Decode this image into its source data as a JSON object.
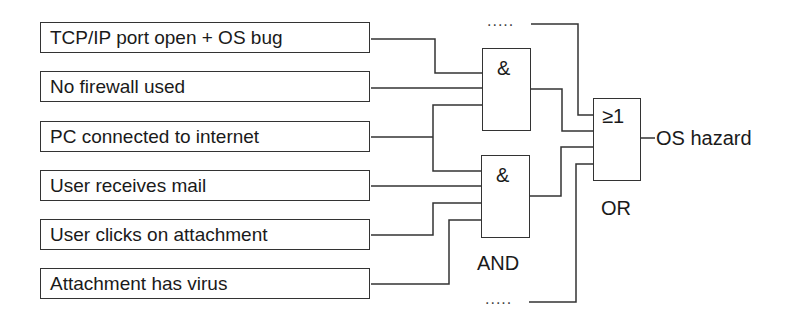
{
  "diagram": {
    "type": "fault-tree",
    "inputs": [
      {
        "label": "TCP/IP port open + OS bug"
      },
      {
        "label": "No firewall used"
      },
      {
        "label": "PC connected to internet"
      },
      {
        "label": "User receives mail"
      },
      {
        "label": "User clicks on attachment"
      },
      {
        "label": "Attachment has virus"
      }
    ],
    "gates": {
      "and_upper": {
        "symbol": "&"
      },
      "and_lower": {
        "symbol": "&",
        "caption": "AND"
      },
      "or": {
        "symbol": "≥1",
        "caption": "OR"
      }
    },
    "output": {
      "label": "OS hazard"
    },
    "ellipsis": {
      "top": ".....",
      "bottom": "....."
    },
    "connections": [
      {
        "from": "TCP/IP port open + OS bug",
        "to": "and_upper"
      },
      {
        "from": "No firewall used",
        "to": "and_upper"
      },
      {
        "from": "PC connected to internet",
        "to": [
          "and_upper",
          "and_lower"
        ]
      },
      {
        "from": "User receives mail",
        "to": "and_lower"
      },
      {
        "from": "User clicks on attachment",
        "to": "and_lower"
      },
      {
        "from": "Attachment has virus",
        "to": "and_lower"
      },
      {
        "from": "and_upper",
        "to": "or"
      },
      {
        "from": "and_lower",
        "to": "or"
      },
      {
        "from": "ellipsis_top",
        "to": "or"
      },
      {
        "from": "ellipsis_bottom",
        "to": "or"
      },
      {
        "from": "or",
        "to": "OS hazard"
      }
    ]
  }
}
